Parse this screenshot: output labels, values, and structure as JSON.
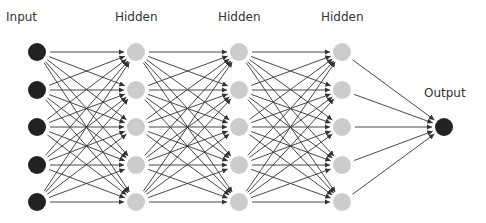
{
  "diagram": {
    "colors": {
      "input_node": "#222222",
      "hidden_node": "#cccccc",
      "output_node": "#222222",
      "edge": "#333333",
      "label": "#333333"
    },
    "node_radius": 9,
    "layers": [
      {
        "label": "Input",
        "x": 37,
        "label_x": 6,
        "label_y": 10,
        "type": "input",
        "nodes_y": [
          52,
          90,
          127,
          165,
          202
        ]
      },
      {
        "label": "Hidden",
        "x": 136,
        "label_x": 115,
        "label_y": 10,
        "type": "hidden",
        "nodes_y": [
          52,
          90,
          127,
          165,
          202
        ]
      },
      {
        "label": "Hidden",
        "x": 239,
        "label_x": 218,
        "label_y": 10,
        "type": "hidden",
        "nodes_y": [
          52,
          90,
          127,
          165,
          202
        ]
      },
      {
        "label": "Hidden",
        "x": 342,
        "label_x": 321,
        "label_y": 10,
        "type": "hidden",
        "nodes_y": [
          52,
          90,
          127,
          165,
          202
        ]
      },
      {
        "label": "Output",
        "x": 444,
        "label_x": 424,
        "label_y": 86,
        "type": "output",
        "nodes_y": [
          127
        ]
      }
    ],
    "connectivity": "fully-connected"
  }
}
